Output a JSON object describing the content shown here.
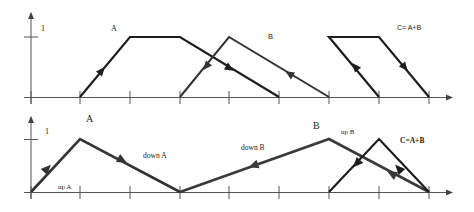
{
  "top_panel": {
    "y_tick_label": "1",
    "labels": {
      "a": "A",
      "b": "B",
      "c": "C= A+B"
    },
    "x_ticks": [
      31,
      80,
      130,
      180,
      229,
      279,
      329,
      379,
      429
    ],
    "paths": {
      "a": [
        [
          80,
          97
        ],
        [
          130,
          37
        ],
        [
          180,
          37
        ],
        [
          279,
          97
        ]
      ],
      "b": [
        [
          180,
          97
        ],
        [
          229,
          37
        ],
        [
          329,
          97
        ]
      ],
      "c": [
        [
          379,
          97
        ],
        [
          329,
          37
        ],
        [
          379,
          37
        ],
        [
          429,
          97
        ]
      ]
    }
  },
  "bottom_panel": {
    "y_tick_label": "1",
    "labels": {
      "a": "A",
      "b": "B",
      "c": "C=A+B",
      "up_a": "up A",
      "down_a": "down A",
      "down_b": "down B",
      "up_b": "up B"
    },
    "x_ticks": [
      31,
      80,
      130,
      180,
      229,
      279,
      329,
      379,
      429
    ],
    "paths": {
      "a": [
        [
          31,
          192
        ],
        [
          80,
          139
        ],
        [
          180,
          192
        ]
      ],
      "b": [
        [
          180,
          192
        ],
        [
          329,
          139
        ],
        [
          429,
          192
        ]
      ],
      "c": [
        [
          329,
          192
        ],
        [
          379,
          139
        ],
        [
          429,
          192
        ]
      ]
    }
  },
  "colors": {
    "primary_line": "#1e1e1e",
    "secondary_line": "#3a3a3a",
    "axis": "#555555"
  }
}
